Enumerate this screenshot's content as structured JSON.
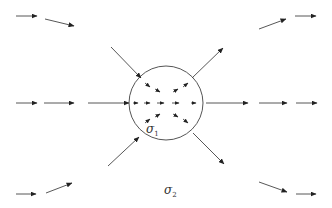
{
  "figure": {
    "colors": {
      "line": "#444444",
      "arrow": "#222222",
      "circle": "#555555",
      "background": "#ffffff"
    },
    "circle": {
      "cx": 166,
      "cy": 103,
      "r": 37
    },
    "labels": {
      "inner": {
        "symbol": "σ",
        "sub": "1",
        "x": 146,
        "y": 122
      },
      "outer": {
        "symbol": "σ",
        "sub": "2",
        "x": 164,
        "y": 183
      }
    },
    "outer_arrows": [
      {
        "id": "tl-1",
        "x1": 16,
        "y1": 16,
        "x2": 37,
        "y2": 16
      },
      {
        "id": "tl-2",
        "x1": 45,
        "y1": 19,
        "x2": 74,
        "y2": 26
      },
      {
        "id": "tr-1",
        "x1": 259,
        "y1": 29,
        "x2": 286,
        "y2": 19
      },
      {
        "id": "tr-2",
        "x1": 295,
        "y1": 16,
        "x2": 316,
        "y2": 16
      },
      {
        "id": "ml-1",
        "x1": 16,
        "y1": 103,
        "x2": 37,
        "y2": 103
      },
      {
        "id": "ml-2",
        "x1": 44,
        "y1": 103,
        "x2": 74,
        "y2": 103
      },
      {
        "id": "ml-3",
        "x1": 88,
        "y1": 103,
        "x2": 129,
        "y2": 103
      },
      {
        "id": "mr-1",
        "x1": 206,
        "y1": 103,
        "x2": 248,
        "y2": 103
      },
      {
        "id": "mr-2",
        "x1": 259,
        "y1": 103,
        "x2": 287,
        "y2": 103
      },
      {
        "id": "mr-3",
        "x1": 296,
        "y1": 103,
        "x2": 317,
        "y2": 103
      },
      {
        "id": "bl-1",
        "x1": 16,
        "y1": 194,
        "x2": 36,
        "y2": 194
      },
      {
        "id": "bl-2",
        "x1": 46,
        "y1": 193,
        "x2": 72,
        "y2": 183
      },
      {
        "id": "br-1",
        "x1": 259,
        "y1": 182,
        "x2": 287,
        "y2": 192
      },
      {
        "id": "br-2",
        "x1": 296,
        "y1": 194,
        "x2": 316,
        "y2": 194
      },
      {
        "id": "in-top",
        "x1": 111,
        "y1": 47,
        "x2": 141,
        "y2": 78
      },
      {
        "id": "in-bot",
        "x1": 108,
        "y1": 166,
        "x2": 139,
        "y2": 137
      },
      {
        "id": "out-top",
        "x1": 192,
        "y1": 78,
        "x2": 223,
        "y2": 48
      },
      {
        "id": "out-bot",
        "x1": 193,
        "y1": 133,
        "x2": 224,
        "y2": 164
      }
    ],
    "inner_arrows": [
      {
        "id": "i1",
        "x1": 145,
        "y1": 83,
        "x2": 150,
        "y2": 87
      },
      {
        "id": "i2",
        "x1": 155,
        "y1": 89,
        "x2": 160,
        "y2": 92
      },
      {
        "id": "i3",
        "x1": 173,
        "y1": 92,
        "x2": 178,
        "y2": 89
      },
      {
        "id": "i4",
        "x1": 183,
        "y1": 87,
        "x2": 188,
        "y2": 83
      },
      {
        "id": "i5",
        "x1": 133,
        "y1": 103,
        "x2": 138,
        "y2": 103
      },
      {
        "id": "i6",
        "x1": 144,
        "y1": 103,
        "x2": 150,
        "y2": 103
      },
      {
        "id": "i7",
        "x1": 157,
        "y1": 103,
        "x2": 164,
        "y2": 103
      },
      {
        "id": "i8",
        "x1": 172,
        "y1": 103,
        "x2": 179,
        "y2": 103
      },
      {
        "id": "i9",
        "x1": 191,
        "y1": 103,
        "x2": 196,
        "y2": 103
      },
      {
        "id": "i10",
        "x1": 145,
        "y1": 123,
        "x2": 150,
        "y2": 119
      },
      {
        "id": "i11",
        "x1": 155,
        "y1": 117,
        "x2": 160,
        "y2": 114
      },
      {
        "id": "i12",
        "x1": 173,
        "y1": 114,
        "x2": 178,
        "y2": 117
      },
      {
        "id": "i13",
        "x1": 183,
        "y1": 119,
        "x2": 188,
        "y2": 123
      }
    ]
  }
}
